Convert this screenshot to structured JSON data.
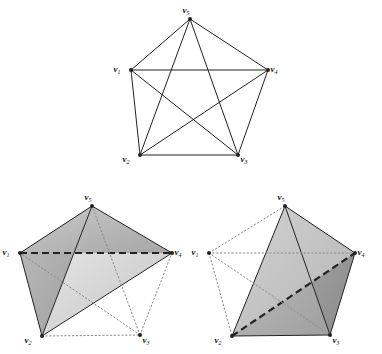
{
  "figure": {
    "background_color": "#ffffff",
    "ink_color": "#222222",
    "panels": [
      {
        "id": "panel-top-pentagon",
        "name": "complete-graph-k5",
        "caption": "",
        "vertices": [
          {
            "id": "v1",
            "label": "v",
            "subscript": "1",
            "x": 131,
            "y": 70,
            "label_x": 117,
            "label_y": 70
          },
          {
            "id": "v2",
            "label": "v",
            "subscript": "2",
            "x": 140,
            "y": 155,
            "label_x": 126,
            "label_y": 160
          },
          {
            "id": "v3",
            "label": "v",
            "subscript": "3",
            "x": 238,
            "y": 155,
            "label_x": 244,
            "label_y": 160
          },
          {
            "id": "v4",
            "label": "v",
            "subscript": "4",
            "x": 268,
            "y": 70,
            "label_x": 274,
            "label_y": 70
          },
          {
            "id": "v5",
            "label": "v",
            "subscript": "5",
            "x": 190,
            "y": 19,
            "label_x": 186,
            "label_y": 11
          }
        ],
        "edges": [
          {
            "from": "v1",
            "to": "v2",
            "style": "solid"
          },
          {
            "from": "v2",
            "to": "v3",
            "style": "solid"
          },
          {
            "from": "v3",
            "to": "v4",
            "style": "solid"
          },
          {
            "from": "v4",
            "to": "v5",
            "style": "solid"
          },
          {
            "from": "v5",
            "to": "v1",
            "style": "solid"
          },
          {
            "from": "v1",
            "to": "v3",
            "style": "solid"
          },
          {
            "from": "v1",
            "to": "v4",
            "style": "solid"
          },
          {
            "from": "v2",
            "to": "v4",
            "style": "solid"
          },
          {
            "from": "v2",
            "to": "v5",
            "style": "solid"
          },
          {
            "from": "v3",
            "to": "v5",
            "style": "solid"
          }
        ]
      },
      {
        "id": "panel-bottom-left",
        "name": "realization-left",
        "caption": "",
        "vertices": [
          {
            "id": "v1",
            "label": "v",
            "subscript": "1",
            "x": 20,
            "y": 253,
            "label_x": 6,
            "label_y": 253
          },
          {
            "id": "v2",
            "label": "v",
            "subscript": "2",
            "x": 42,
            "y": 336,
            "label_x": 28,
            "label_y": 341
          },
          {
            "id": "v3",
            "label": "v",
            "subscript": "3",
            "x": 140,
            "y": 335,
            "label_x": 146,
            "label_y": 341
          },
          {
            "id": "v4",
            "label": "v",
            "subscript": "4",
            "x": 172,
            "y": 253,
            "label_x": 178,
            "label_y": 253
          },
          {
            "id": "v5",
            "label": "v",
            "subscript": "5",
            "x": 92,
            "y": 206,
            "label_x": 88,
            "label_y": 198
          }
        ],
        "faces": [
          {
            "verts": [
              "v1",
              "v5",
              "v2"
            ],
            "fill": "#a9a9a9"
          },
          {
            "verts": [
              "v5",
              "v2",
              "v4"
            ],
            "fill": "#d8d8d8"
          },
          {
            "verts": [
              "v5",
              "v4",
              "v1"
            ],
            "fill": "#b4b4b4"
          }
        ],
        "edges": [
          {
            "from": "v1",
            "to": "v5",
            "style": "solid"
          },
          {
            "from": "v5",
            "to": "v4",
            "style": "solid"
          },
          {
            "from": "v1",
            "to": "v2",
            "style": "solid"
          },
          {
            "from": "v2",
            "to": "v4",
            "style": "solid"
          },
          {
            "from": "v5",
            "to": "v2",
            "style": "solid"
          },
          {
            "from": "v1",
            "to": "v4",
            "style": "dashed"
          },
          {
            "from": "v2",
            "to": "v3",
            "style": "dotted"
          },
          {
            "from": "v3",
            "to": "v4",
            "style": "dotted"
          },
          {
            "from": "v3",
            "to": "v5",
            "style": "dotted"
          },
          {
            "from": "v3",
            "to": "v1",
            "style": "dotted"
          }
        ]
      },
      {
        "id": "panel-bottom-right",
        "name": "realization-right",
        "caption": "",
        "vertices": [
          {
            "id": "v1",
            "label": "v",
            "subscript": "1",
            "x": 209,
            "y": 253,
            "label_x": 195,
            "label_y": 253
          },
          {
            "id": "v2",
            "label": "v",
            "subscript": "2",
            "x": 232,
            "y": 336,
            "label_x": 218,
            "label_y": 341
          },
          {
            "id": "v3",
            "label": "v",
            "subscript": "3",
            "x": 330,
            "y": 335,
            "label_x": 336,
            "label_y": 341
          },
          {
            "id": "v4",
            "label": "v",
            "subscript": "4",
            "x": 355,
            "y": 253,
            "label_x": 361,
            "label_y": 253
          },
          {
            "id": "v5",
            "label": "v",
            "subscript": "5",
            "x": 285,
            "y": 206,
            "label_x": 281,
            "label_y": 198
          }
        ],
        "faces": [
          {
            "verts": [
              "v5",
              "v2",
              "v3"
            ],
            "fill": "#b0b0b0"
          },
          {
            "verts": [
              "v5",
              "v3",
              "v4"
            ],
            "fill": "#9a9a9a"
          },
          {
            "verts": [
              "v5",
              "v2",
              "v4"
            ],
            "fill": "#c2c2c2"
          }
        ],
        "edges": [
          {
            "from": "v5",
            "to": "v2",
            "style": "solid"
          },
          {
            "from": "v5",
            "to": "v3",
            "style": "solid"
          },
          {
            "from": "v5",
            "to": "v4",
            "style": "solid"
          },
          {
            "from": "v2",
            "to": "v3",
            "style": "solid"
          },
          {
            "from": "v3",
            "to": "v4",
            "style": "solid"
          },
          {
            "from": "v2",
            "to": "v4",
            "style": "dashed"
          },
          {
            "from": "v1",
            "to": "v5",
            "style": "dotted"
          },
          {
            "from": "v1",
            "to": "v2",
            "style": "dotted"
          },
          {
            "from": "v1",
            "to": "v3",
            "style": "dotted"
          },
          {
            "from": "v1",
            "to": "v4",
            "style": "dotted"
          }
        ]
      }
    ]
  }
}
